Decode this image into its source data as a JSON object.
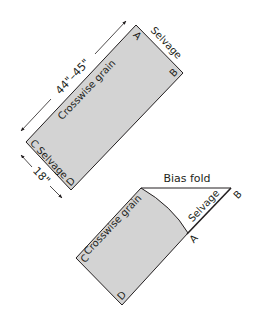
{
  "colors": {
    "fabric_fill": "#d3d3d3",
    "outline": "#231f20",
    "background": "#ffffff"
  },
  "top_panel": {
    "corner_a": "A",
    "corner_b": "B",
    "corner_c": "C",
    "corner_d": "D",
    "selvage_top": "Selvage",
    "selvage_bottom": "Selvage",
    "grain_label": "Crosswise grain",
    "length_dimension": "44\"–45\"",
    "width_dimension": "18\""
  },
  "bottom_panel": {
    "corner_a": "A",
    "corner_b": "B",
    "corner_c": "C",
    "corner_d": "D",
    "fold_label": "Bias fold",
    "selvage_label": "Selvage",
    "grain_label": "Crosswise grain"
  }
}
